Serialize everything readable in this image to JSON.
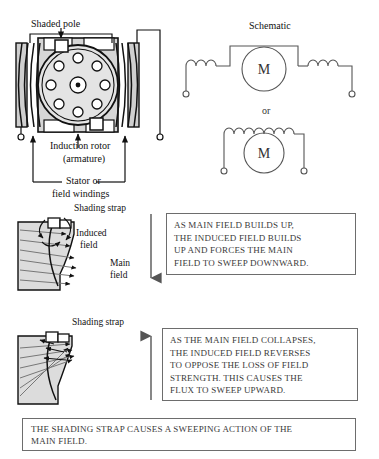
{
  "figure": {
    "topic": "shaded-pole-motor",
    "background_color": "#ffffff",
    "ink_color": "#111111",
    "pole_fill": "#d9d9d9",
    "frame_fill": "#cfcfcf"
  },
  "motor_diagram": {
    "title_label": "Shaded pole",
    "rotor_label_line1": "Induction rotor",
    "rotor_label_line2": "(armature)",
    "stator_label_line1": "Stator or",
    "stator_label_line2": "field windings",
    "rotor_conductor_count": 8,
    "shaded_pole_blocks": 2
  },
  "schematic": {
    "title": "Schematic",
    "or_label": "or",
    "motor_symbol": "M",
    "top_circuit": {
      "left_coil_loops": 3,
      "right_coil_loops": 3,
      "motor_symbol": "M",
      "terminal_count": 2
    },
    "bottom_circuit": {
      "coil_loops": 7,
      "motor_symbol": "M",
      "terminal_count": 2
    }
  },
  "panel_build": {
    "strap_label": "Shading strap",
    "induced_field_line1": "Induced",
    "induced_field_line2": "field",
    "main_field_line1": "Main",
    "main_field_line2": "field",
    "arrow_direction": "down",
    "callout_lines": [
      "AS MAIN FIELD BUILDS UP,",
      "THE INDUCED FIELD BUILDS",
      "UP AND FORCES THE MAIN",
      "FIELD TO SWEEP DOWNWARD."
    ]
  },
  "panel_collapse": {
    "strap_label": "Shading strap",
    "arrow_direction": "up",
    "callout_lines": [
      "AS THE MAIN FIELD COLLAPSES,",
      "THE INDUCED FIELD REVERSES",
      "TO OPPOSE THE LOSS OF FIELD",
      "STRENGTH. THIS CAUSES THE",
      "FLUX TO SWEEP UPWARD."
    ]
  },
  "summary": {
    "lines": [
      "THE SHADING STRAP CAUSES A SWEEPING ACTION OF THE",
      "MAIN FIELD."
    ]
  }
}
